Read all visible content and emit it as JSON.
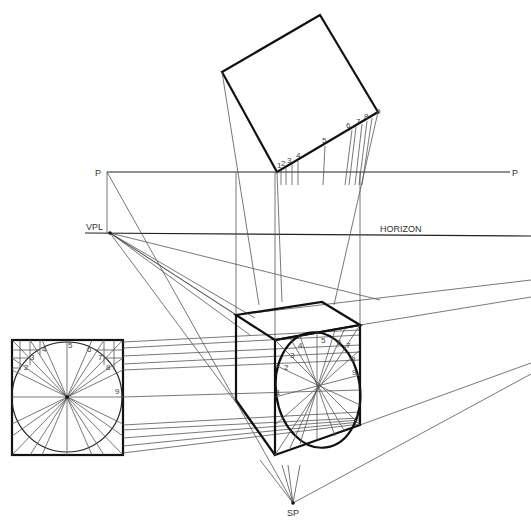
{
  "diagram": {
    "labels": {
      "picture_plane_left": "P",
      "picture_plane_right": "P",
      "vanishing_point_left": "VPL",
      "horizon": "HORIZON",
      "station_point": "SP"
    },
    "division_points": [
      "1",
      "2",
      "3",
      "4",
      "5",
      "6",
      "7",
      "8",
      "9"
    ],
    "plan_view_points": [
      "1",
      "2",
      "3",
      "4",
      "5",
      "6",
      "7",
      "8",
      "9"
    ],
    "elevation_points": [
      "2",
      "3",
      "4",
      "5",
      "6",
      "7",
      "8",
      "9"
    ],
    "perspective_points": [
      "1",
      "2",
      "3",
      "4",
      "5",
      "6",
      "7",
      "8",
      "9"
    ],
    "colors": {
      "line": "#111111",
      "construction": "#555555",
      "background": "#ffffff"
    }
  }
}
